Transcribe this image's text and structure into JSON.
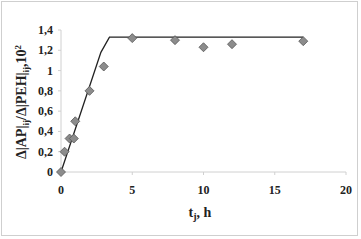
{
  "chart_data": {
    "type": "scatter",
    "title": "",
    "xlabel_main": "t",
    "xlabel_sub": "j",
    "xlabel_rest": ", h",
    "ylabel": "Δ|AP|ij/Δ|PEH|ij·10²",
    "ylabel_parts": {
      "a": "Δ|AP|",
      "a_sub": "ij",
      "b": "/Δ|PEH|",
      "b_sub": "ij",
      "c": ",10",
      "c_sup": "2"
    },
    "xlim": [
      0,
      20
    ],
    "ylim": [
      0,
      1.4
    ],
    "x_ticks": [
      0,
      5,
      10,
      15,
      20
    ],
    "x_tick_labels": [
      "0",
      "5",
      "10",
      "15",
      "20"
    ],
    "y_ticks": [
      0,
      0.2,
      0.4,
      0.6,
      0.8,
      1.0,
      1.2,
      1.4
    ],
    "y_tick_labels": [
      "0",
      "0,2",
      "0,4",
      "0,6",
      "0,8",
      "1",
      "1,2",
      "1,4"
    ],
    "grid": false,
    "legend": "none",
    "series": [
      {
        "name": "experimental",
        "kind": "scatter",
        "marker": "diamond",
        "color": "#8c8c8c",
        "x": [
          0,
          0.25,
          0.6,
          0.9,
          1.0,
          2.0,
          3.0,
          5.0,
          8.0,
          10.0,
          12.0,
          17.0
        ],
        "y": [
          0,
          0.2,
          0.33,
          0.33,
          0.5,
          0.8,
          1.04,
          1.32,
          1.3,
          1.23,
          1.26,
          1.29
        ]
      },
      {
        "name": "model",
        "kind": "line",
        "color": "#222222",
        "x": [
          0,
          2.8,
          3.4,
          17.0
        ],
        "y": [
          0,
          1.18,
          1.33,
          1.33
        ]
      }
    ]
  }
}
